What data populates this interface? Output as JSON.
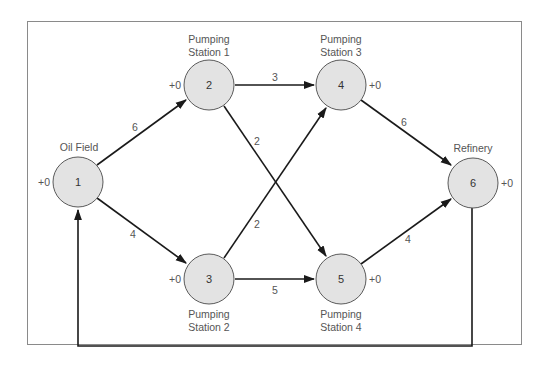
{
  "diagram": {
    "colors": {
      "node_fill": "#e3e3e3",
      "node_stroke": "#5a5a5a",
      "edge": "#1a1a1a",
      "frame": "#8a8a8a",
      "text": "#555555"
    },
    "nodes": [
      {
        "id": "1",
        "label": "1",
        "name": "Oil Field",
        "offset": "+0"
      },
      {
        "id": "2",
        "label": "2",
        "name_line1": "Pumping",
        "name_line2": "Station 1",
        "offset": "+0"
      },
      {
        "id": "3",
        "label": "3",
        "name_line1": "Pumping",
        "name_line2": "Station 2",
        "offset": "+0"
      },
      {
        "id": "4",
        "label": "4",
        "name_line1": "Pumping",
        "name_line2": "Station 3",
        "offset": "+0"
      },
      {
        "id": "5",
        "label": "5",
        "name_line1": "Pumping",
        "name_line2": "Station 4",
        "offset": "+0"
      },
      {
        "id": "6",
        "label": "6",
        "name": "Refinery",
        "offset": "+0"
      }
    ],
    "edges": [
      {
        "from": "1",
        "to": "2",
        "capacity": "6"
      },
      {
        "from": "1",
        "to": "3",
        "capacity": "4"
      },
      {
        "from": "2",
        "to": "4",
        "capacity": "3"
      },
      {
        "from": "2",
        "to": "5",
        "capacity": "2"
      },
      {
        "from": "3",
        "to": "4",
        "capacity": "2"
      },
      {
        "from": "3",
        "to": "5",
        "capacity": "5"
      },
      {
        "from": "4",
        "to": "6",
        "capacity": "6"
      },
      {
        "from": "5",
        "to": "6",
        "capacity": "4"
      },
      {
        "from": "6",
        "to": "1",
        "capacity": ""
      }
    ]
  }
}
